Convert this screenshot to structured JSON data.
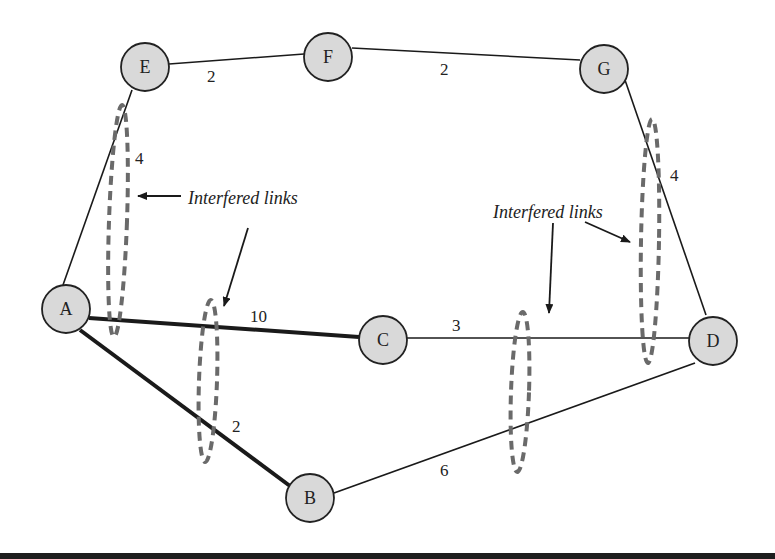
{
  "diagram": {
    "type": "network-graph",
    "colors": {
      "node_fill": "#d9d9d9",
      "node_stroke": "#222222",
      "edge": "#1a1a1a",
      "interference": "#6a6a6a",
      "background": "#ffffff"
    },
    "nodes": [
      {
        "id": "A",
        "label": "A",
        "x": 66,
        "y": 309
      },
      {
        "id": "B",
        "label": "B",
        "x": 310,
        "y": 498
      },
      {
        "id": "C",
        "label": "C",
        "x": 383,
        "y": 340
      },
      {
        "id": "D",
        "label": "D",
        "x": 713,
        "y": 341
      },
      {
        "id": "E",
        "label": "E",
        "x": 145,
        "y": 67
      },
      {
        "id": "F",
        "label": "F",
        "x": 328,
        "y": 57
      },
      {
        "id": "G",
        "label": "G",
        "x": 604,
        "y": 69
      }
    ],
    "edges": [
      {
        "from": "E",
        "to": "F",
        "weight": "2",
        "bold": false
      },
      {
        "from": "F",
        "to": "G",
        "weight": "2",
        "bold": false
      },
      {
        "from": "E",
        "to": "A",
        "weight": "4",
        "bold": false
      },
      {
        "from": "G",
        "to": "D",
        "weight": "4",
        "bold": false
      },
      {
        "from": "A",
        "to": "C",
        "weight": "10",
        "bold": true
      },
      {
        "from": "C",
        "to": "D",
        "weight": "3",
        "bold": false
      },
      {
        "from": "A",
        "to": "B",
        "weight": "2",
        "bold": true
      },
      {
        "from": "B",
        "to": "D",
        "weight": "6",
        "bold": false
      }
    ],
    "annotations": [
      {
        "text": "Interfered links"
      },
      {
        "text": "Interfered links"
      }
    ]
  }
}
